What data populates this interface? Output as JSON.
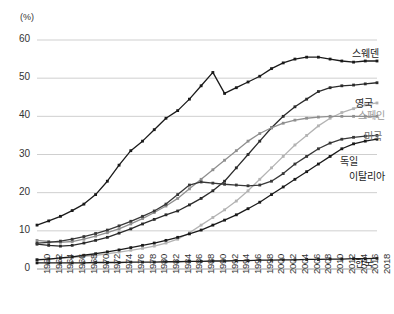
{
  "chart_data": {
    "type": "line",
    "title": "",
    "subtitle": "",
    "xlabel": "",
    "ylabel": "(%)",
    "unit_label": "(%)",
    "grid": true,
    "legend_position": "right-inline",
    "xlim": [
      1960,
      2018
    ],
    "ylim": [
      0,
      60
    ],
    "yticks": [
      0,
      10,
      20,
      30,
      40,
      50,
      60
    ],
    "x": [
      1960,
      1962,
      1964,
      1966,
      1968,
      1970,
      1972,
      1974,
      1976,
      1978,
      1980,
      1982,
      1984,
      1986,
      1988,
      1990,
      1992,
      1994,
      1996,
      1998,
      2000,
      2002,
      2004,
      2006,
      2008,
      2010,
      2012,
      2014,
      2016,
      2018
    ],
    "xtick_labels": [
      "1960",
      "1962",
      "1964",
      "1966",
      "1968",
      "1970",
      "1972",
      "1974",
      "1976",
      "1978",
      "1980",
      "1982",
      "1984",
      "1986",
      "1988",
      "1990",
      "1992",
      "1994",
      "1996",
      "1998",
      "2000",
      "2002",
      "2004",
      "2006",
      "2008",
      "2010",
      "2012",
      "2014",
      "2016",
      "2018"
    ],
    "series": [
      {
        "name": "스웨덴",
        "color": "#1a1a1a",
        "label_color": "#1a1a1a",
        "values": [
          11.5,
          12.6,
          13.8,
          15.3,
          17.0,
          19.5,
          23.0,
          27.2,
          31.0,
          33.5,
          36.5,
          39.5,
          41.5,
          44.5,
          48.0,
          51.5,
          46.0,
          47.5,
          49.0,
          50.5,
          52.5,
          54.0,
          55.0,
          55.5,
          55.5,
          55.0,
          54.5,
          54.2,
          54.5,
          54.5
        ]
      },
      {
        "name": "영국",
        "color": "#2b2b2b",
        "label_color": "#2b2b2b",
        "values": [
          6.5,
          6.2,
          6.0,
          6.2,
          6.8,
          7.5,
          8.3,
          9.4,
          10.5,
          11.8,
          13.0,
          14.2,
          15.2,
          16.8,
          18.5,
          20.5,
          23.0,
          26.5,
          30.0,
          33.5,
          37.0,
          40.0,
          42.5,
          44.5,
          46.5,
          47.5,
          48.0,
          48.2,
          48.5,
          48.8
        ]
      },
      {
        "name": "스페인",
        "color": "#b3b3b3",
        "label_color": "#9b9b9b",
        "values": [
          2.5,
          2.6,
          2.8,
          3.0,
          3.3,
          3.6,
          4.0,
          4.4,
          4.9,
          5.4,
          6.0,
          6.8,
          7.8,
          9.5,
          11.5,
          13.5,
          15.5,
          17.8,
          20.5,
          23.5,
          26.5,
          29.5,
          32.5,
          35.0,
          37.5,
          39.5,
          41.0,
          42.0,
          43.0,
          43.5
        ]
      },
      {
        "name": "미국",
        "color": "#8f8f8f",
        "label_color": "#6e6e6e",
        "values": [
          7.5,
          7.2,
          7.0,
          7.2,
          7.8,
          8.6,
          9.5,
          10.5,
          11.8,
          13.2,
          14.8,
          16.5,
          18.5,
          21.0,
          23.5,
          26.0,
          28.5,
          31.0,
          33.5,
          35.5,
          37.0,
          38.2,
          39.0,
          39.5,
          39.8,
          40.0,
          40.0,
          40.0,
          40.0,
          40.0
        ]
      },
      {
        "name": "독일",
        "color": "#383838",
        "label_color": "#2b2b2b",
        "values": [
          6.8,
          7.0,
          7.3,
          7.8,
          8.5,
          9.3,
          10.2,
          11.3,
          12.5,
          13.8,
          15.2,
          17.0,
          19.5,
          22.0,
          22.8,
          22.5,
          22.2,
          22.0,
          21.8,
          22.0,
          23.0,
          25.0,
          27.5,
          29.5,
          31.5,
          33.0,
          34.0,
          34.5,
          34.8,
          35.0
        ]
      },
      {
        "name": "이탈리아",
        "color": "#1a1a1a",
        "label_color": "#1a1a1a",
        "values": [
          2.4,
          2.6,
          2.9,
          3.2,
          3.6,
          4.0,
          4.5,
          5.0,
          5.6,
          6.2,
          6.8,
          7.5,
          8.3,
          9.2,
          10.2,
          11.5,
          12.8,
          14.2,
          15.8,
          17.5,
          19.5,
          21.5,
          23.5,
          25.5,
          27.5,
          29.5,
          31.5,
          32.8,
          33.5,
          34.0
        ]
      },
      {
        "name": "한국",
        "color": "#1a1a1a",
        "label_color": "#1a1a1a",
        "values": [
          1.6,
          1.6,
          1.6,
          1.6,
          1.6,
          1.7,
          1.7,
          1.7,
          1.8,
          1.8,
          1.8,
          1.9,
          1.9,
          2.0,
          2.0,
          2.1,
          2.1,
          2.2,
          2.2,
          2.3,
          2.3,
          2.4,
          2.4,
          2.5,
          2.5,
          2.6,
          2.6,
          2.7,
          2.7,
          2.8
        ]
      }
    ],
    "series_label_positions": [
      {
        "name": "스웨덴",
        "x": 352,
        "y": 45
      },
      {
        "name": "영국",
        "x": 355,
        "y": 95
      },
      {
        "name": "스페인",
        "x": 358,
        "y": 107
      },
      {
        "name": "미국",
        "x": 364,
        "y": 128
      },
      {
        "name": "독일",
        "x": 340,
        "y": 153
      },
      {
        "name": "이탈리아",
        "x": 349,
        "y": 168
      },
      {
        "name": "한국",
        "x": 355,
        "y": 255
      }
    ]
  }
}
